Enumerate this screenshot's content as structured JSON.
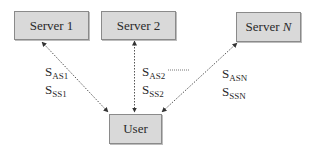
{
  "diagram": {
    "nodes": {
      "server1": {
        "label": "Server 1"
      },
      "server2": {
        "label": "Server 2"
      },
      "serverN": {
        "label_prefix": "Server ",
        "label_italic": "N"
      },
      "user": {
        "label": "User"
      }
    },
    "edges": [
      {
        "from": "user",
        "to": "server1",
        "style": "dotted",
        "arrows": "both"
      },
      {
        "from": "user",
        "to": "server2",
        "style": "dotted",
        "arrows": "both"
      },
      {
        "from": "user",
        "to": "serverN",
        "style": "dotted",
        "arrows": "both"
      }
    ],
    "labels": {
      "edge1": {
        "as": {
          "base": "S",
          "sub": "AS1"
        },
        "ss": {
          "base": "S",
          "sub": "SS1"
        }
      },
      "edge2": {
        "as": {
          "base": "S",
          "sub": "AS2"
        },
        "ss": {
          "base": "S",
          "sub": "SS2"
        }
      },
      "edgeN": {
        "as": {
          "base": "S",
          "sub": "ASN"
        },
        "ss": {
          "base": "S",
          "sub": "SSN"
        }
      },
      "ellipsis": "......."
    },
    "colors": {
      "node_fill": "#d9d9d9",
      "node_border": "#8a8a8a",
      "edge": "#555555"
    }
  }
}
